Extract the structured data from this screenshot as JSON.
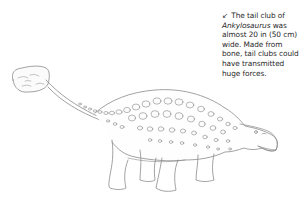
{
  "caption": {
    "arrow_icon": "↙",
    "lead": "The tail club of",
    "species": "Ankylosaurus",
    "rest": " was almost 20 in (50 cm) wide. Made from bone, tail clubs could have transmitted huge forces."
  },
  "illustration": {
    "subject": "Ankylosaurus",
    "style": "pencil line drawing",
    "stroke_color": "#8a8a8a",
    "fill_color": "#ffffff"
  }
}
